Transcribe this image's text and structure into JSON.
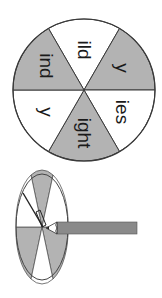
{
  "wheel": {
    "center": [
      84,
      90
    ],
    "radius": 71,
    "rotation_deg": 90,
    "colors": {
      "shaded": "#b3b3b3",
      "plain": "#ffffff",
      "stroke": "#3a3a3a"
    },
    "segments": [
      {
        "label": "ild",
        "shaded": false
      },
      {
        "label": "y",
        "shaded": true
      },
      {
        "label": "ies",
        "shaded": false
      },
      {
        "label": "ight",
        "shaded": true
      },
      {
        "label": "y",
        "shaded": false
      },
      {
        "label": "ind",
        "shaded": true
      }
    ]
  },
  "spinner": {
    "description": "pencil-and-paperclip spinner",
    "colors": {
      "shaded": "#b3b3b3",
      "pencil": "#8a8a8a"
    }
  }
}
